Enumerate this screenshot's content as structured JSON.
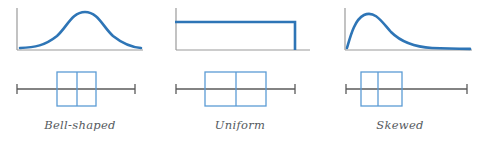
{
  "figure": {
    "background": "#ffffff",
    "width": 478,
    "height": 152
  },
  "colors": {
    "curve_blue": "#2E75B6",
    "box_blue": "#5B9BD5",
    "axis_gray": "#9a9a9a",
    "whisker_gray": "#5a5a5a",
    "label_gray": "#555a5e"
  },
  "panels": [
    {
      "id": "bell-shaped",
      "label": "Bell-shaped",
      "curve": {
        "shape": "symmetric-bell",
        "description": "Symmetric bell-shaped density curve with a single central peak",
        "peak_x_fraction": 0.5,
        "path": "M 3,45 C 18,44 28,42 40,32 C 50,23 55,8 68,8 C 81,8 86,23 96,32 C 108,42 118,44 133,45"
      },
      "boxplot": {
        "min": 0.0,
        "q1": 0.34,
        "median": 0.5,
        "q3": 0.66,
        "max": 1.0,
        "symmetry": "symmetric",
        "description": "Box centered on the median with equal whiskers on both sides"
      }
    },
    {
      "id": "uniform",
      "label": "Uniform",
      "curve": {
        "shape": "rectangular-uniform",
        "description": "Flat-topped rectangular density, constant across the range then dropping to zero",
        "top_level": 0.78,
        "path": "M 0,8 L 119,8 L 119,45"
      },
      "boxplot": {
        "min": 0.0,
        "q1": 0.245,
        "median": 0.5,
        "q3": 0.755,
        "max": 1.0,
        "symmetry": "symmetric-wide-box",
        "description": "Wide box centered on the median with short equal whiskers"
      }
    },
    {
      "id": "skewed",
      "label": "Skewed",
      "curve": {
        "shape": "right-skewed",
        "description": "Right-skewed density with a steep left rise, early peak and a long right tail",
        "peak_x_fraction": 0.22,
        "path": "M 3,45 C 6,34 10,16 20,11 C 31,6 38,18 47,28 C 58,40 72,44 88,45 C 104,45.6 118,45.8 131,45.9"
      },
      "boxplot": {
        "min": 0.0,
        "q1": 0.125,
        "median": 0.265,
        "q3": 0.46,
        "max": 1.0,
        "symmetry": "right-skewed",
        "description": "Box shifted to the left with the median left of center and a long right whisker"
      }
    }
  ]
}
